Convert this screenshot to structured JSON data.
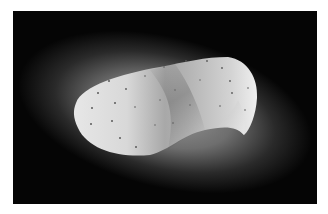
{
  "image": {
    "subject": "perforated curved white sheet",
    "alt": "A white, saddle-shaped curved sheet with small perforation dots, lit against a dark radial gradient background",
    "colors": {
      "border": "#ffffff",
      "background_dark": "#050505",
      "glow": "#8a8a8a",
      "sheet_light": "#e6e6e6",
      "sheet_shadow": "#9a9a9a",
      "perforation": "#5a5a5a"
    }
  }
}
